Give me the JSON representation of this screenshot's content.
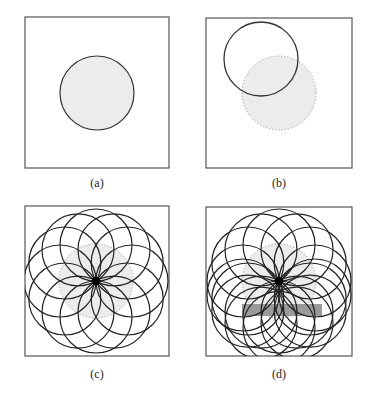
{
  "figure": {
    "panels": [
      {
        "id": "a",
        "label": "(a)",
        "frame": {
          "x": 25,
          "y": 17,
          "w": 144,
          "h": 151
        },
        "label_pos": {
          "x": 97,
          "y": 176
        },
        "shaded_circle": {
          "cx": 97,
          "cy": 93,
          "r": 37,
          "stroke": "solid"
        }
      },
      {
        "id": "b",
        "label": "(b)",
        "frame": {
          "x": 206,
          "y": 18,
          "w": 146,
          "h": 150
        },
        "label_pos": {
          "x": 279,
          "y": 176
        },
        "shaded_circle": {
          "cx": 279,
          "cy": 93,
          "r": 37,
          "stroke": "dotted"
        },
        "outline_circle": {
          "cx": 261,
          "cy": 59,
          "r": 37,
          "stroke": "solid"
        }
      },
      {
        "id": "c",
        "label": "(c)",
        "frame": {
          "x": 25,
          "y": 206,
          "w": 144,
          "h": 150
        },
        "label_pos": {
          "x": 97,
          "y": 367
        },
        "shaded_circle": {
          "cx": 96,
          "cy": 281,
          "r": 37,
          "stroke": "dotted"
        },
        "center_dot": {
          "cx": 96,
          "cy": 281,
          "r": 4
        },
        "rosette": {
          "count": 12,
          "r": 36
        }
      },
      {
        "id": "d",
        "label": "(d)",
        "frame": {
          "x": 206,
          "y": 207,
          "w": 146,
          "h": 149
        },
        "label_pos": {
          "x": 279,
          "y": 367
        },
        "shaded_circle": {
          "cx": 279,
          "cy": 281,
          "r": 37,
          "stroke": "dotted"
        },
        "center_dot": {
          "cx": 279,
          "cy": 281,
          "r": 4
        },
        "rosette": {
          "count": 12,
          "r": 36
        },
        "extra_rosette": {
          "cy_offset": 14,
          "count": 7,
          "r": 36
        },
        "obstacle_rect": {
          "x": 242,
          "y": 304,
          "w": 80,
          "h": 12
        }
      }
    ],
    "colors": {
      "line": "#222222",
      "shade": "#ececec",
      "dotted": "#999999",
      "obstacle": "#9a9a9a"
    }
  }
}
